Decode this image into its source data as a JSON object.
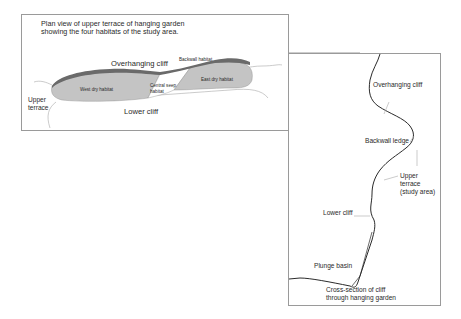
{
  "plan_view": {
    "title_line1": "Plan view of upper terrace of hanging garden",
    "title_line2": "showing the four habitats of the study area.",
    "labels": {
      "overhanging_cliff": "Overhanging cliff",
      "backwall_habitat": "Backwall habitat",
      "west_dry_habitat": "West dry habitat",
      "central_seep_line1": "Central seep",
      "central_seep_line2": "habitat",
      "east_dry_habitat": "East dry habitat",
      "upper_terrace_line1": "Upper",
      "upper_terrace_line2": "terrace",
      "lower_cliff": "Lower cliff"
    }
  },
  "cross_section": {
    "labels": {
      "overhanging_cliff": "Overhanging cliff",
      "backwall_ledge": "Backwall ledge",
      "upper_terrace_line1": "Upper",
      "upper_terrace_line2": "terrace",
      "upper_terrace_line3": "(study area)",
      "lower_cliff": "Lower cliff",
      "plunge_basin": "Plunge basin"
    },
    "caption_line1": "Cross-section of cliff",
    "caption_line2": "through hanging garden"
  },
  "colors": {
    "box_border": "#9a9a9a",
    "habitat_fill": "#c4c4c4",
    "backwall_band": "#6a6a6a",
    "cliff_line": "#2b2b2b",
    "contour_line": "#a8a8a8"
  }
}
